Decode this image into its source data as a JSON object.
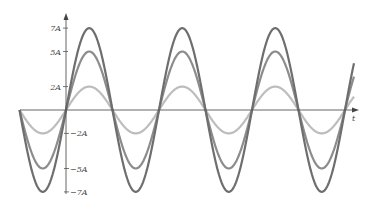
{
  "chart_data": {
    "type": "line",
    "title": "",
    "xlabel": "t",
    "ylabel": "",
    "ytick_labels": [
      "7A",
      "5A",
      "2A",
      "−2A",
      "−5A",
      "−7A"
    ],
    "yticks": [
      7,
      5,
      2,
      -2,
      -5,
      -7
    ],
    "ylim": [
      -7.5,
      8
    ],
    "grid": false,
    "legend": null,
    "x_range_periods": [
      -0.5,
      3.1
    ],
    "series": [
      {
        "name": "7A sine",
        "amplitude": 7,
        "color": "#6e6e6e",
        "function": "7 sin(ωt)"
      },
      {
        "name": "5A sine",
        "amplitude": 5,
        "color": "#8c8c8c",
        "function": "5 sin(ωt)"
      },
      {
        "name": "2A sine",
        "amplitude": 2,
        "color": "#bdbdbd",
        "function": "2 sin(ωt)"
      }
    ]
  },
  "axis": {
    "x_label": "t",
    "pos_labels": [
      {
        "text": "7A",
        "value": 7
      },
      {
        "text": "5A",
        "value": 5
      },
      {
        "text": "2A",
        "value": 2
      }
    ],
    "neg_labels": [
      {
        "text": "−2A",
        "value": -2
      },
      {
        "text": "−5A",
        "value": -5
      },
      {
        "text": "−7A",
        "value": -7
      }
    ]
  }
}
